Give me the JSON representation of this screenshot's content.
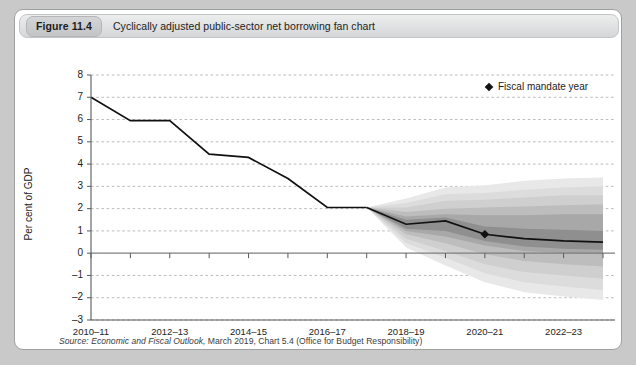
{
  "figure": {
    "number_label": "Figure 11.4",
    "title": "Cyclically adjusted public-sector net borrowing fan chart"
  },
  "source": {
    "label": "Source:",
    "publication": "Economic and Fiscal Outlook,",
    "rest": " March 2019, Chart 5.4 (Office for Budget Responsibility)"
  },
  "legend": {
    "marker": "diamond-marker",
    "label": "Fiscal mandate year"
  },
  "colors": {
    "frame_border": "#9fa0a2",
    "title_bar": "#e2e3e4",
    "line": "#111111",
    "zero_line": "#7d7e80",
    "grid": "#b9bbbd",
    "band_outer": "#e8e8e8",
    "band_mid_outer": "#dcdcdc",
    "band_mid": "#cfcfcf",
    "band_mid_inner": "#bdbdbd",
    "band_inner": "#a8a8a8",
    "band_core": "#8f8f8f"
  },
  "chart_data": {
    "type": "area",
    "title": "Cyclically adjusted public-sector net borrowing fan chart",
    "xlabel": "",
    "ylabel": "Per cent of GDP",
    "ylim": [
      -3,
      8
    ],
    "ytick_values": [
      8,
      7,
      6,
      5,
      4,
      3,
      2,
      1,
      0,
      -1,
      -2,
      -3
    ],
    "ytick_labels": [
      "8",
      "7",
      "6",
      "5",
      "4",
      "3",
      "2",
      "1",
      "0",
      "–1",
      "–2",
      "–3"
    ],
    "grid": true,
    "legend_position": "top-right",
    "x": [
      "2010–11",
      "2011–12",
      "2012–13",
      "2013–14",
      "2014–15",
      "2015–16",
      "2016–17",
      "2017–18",
      "2018–19",
      "2019–20",
      "2020–21",
      "2021–22",
      "2022–23",
      "2023–24"
    ],
    "xtick_labels": [
      "2010–11",
      "2012–13",
      "2014–15",
      "2016–17",
      "2018–19",
      "2020–21",
      "2022–23"
    ],
    "xtick_indices": [
      0,
      2,
      4,
      6,
      8,
      10,
      12
    ],
    "series": [
      {
        "name": "Historical outturn",
        "type": "line",
        "values": [
          7.0,
          5.95,
          5.95,
          4.45,
          4.3,
          3.35,
          2.05,
          2.05,
          null,
          null,
          null,
          null,
          null,
          null
        ]
      },
      {
        "name": "Central forecast",
        "type": "line",
        "values": [
          null,
          null,
          null,
          null,
          null,
          null,
          null,
          2.05,
          1.3,
          1.45,
          0.85,
          0.65,
          0.55,
          0.5
        ]
      }
    ],
    "fan_start_index": 7,
    "fan_bands": [
      {
        "name": "90% interval",
        "shade": "#e8e8e8",
        "upper": [
          2.05,
          2.45,
          2.95,
          3.05,
          3.25,
          3.35,
          3.4
        ],
        "lower": [
          2.05,
          0.25,
          -0.55,
          -1.3,
          -1.75,
          -1.95,
          -2.1
        ]
      },
      {
        "name": "80% interval",
        "shade": "#dcdcdc",
        "upper": [
          2.05,
          2.25,
          2.65,
          2.7,
          2.85,
          2.95,
          3.0
        ],
        "lower": [
          2.05,
          0.45,
          -0.2,
          -0.9,
          -1.3,
          -1.5,
          -1.65
        ]
      },
      {
        "name": "60% interval",
        "shade": "#cfcfcf",
        "upper": [
          2.05,
          2.05,
          2.35,
          2.4,
          2.5,
          2.6,
          2.6
        ],
        "lower": [
          2.05,
          0.65,
          0.1,
          -0.5,
          -0.85,
          -1.0,
          -1.15
        ]
      },
      {
        "name": "40% interval",
        "shade": "#bdbdbd",
        "upper": [
          2.05,
          1.85,
          2.0,
          2.05,
          2.1,
          2.15,
          2.2
        ],
        "lower": [
          2.05,
          0.85,
          0.45,
          -0.05,
          -0.35,
          -0.5,
          -0.6
        ]
      },
      {
        "name": "20% interval",
        "shade": "#a8a8a8",
        "upper": [
          2.05,
          1.65,
          1.75,
          1.7,
          1.7,
          1.75,
          1.75
        ],
        "lower": [
          2.05,
          1.0,
          0.75,
          0.35,
          0.1,
          0.0,
          -0.05
        ]
      },
      {
        "name": "10% interval",
        "shade": "#8f8f8f",
        "upper": [
          2.05,
          1.5,
          1.6,
          1.2,
          1.1,
          1.05,
          1.0
        ],
        "lower": [
          2.05,
          1.1,
          1.0,
          0.55,
          0.3,
          0.2,
          0.15
        ]
      }
    ],
    "annotations": [
      {
        "name": "fiscal-mandate-year",
        "x": "2020–21",
        "y": 0.85,
        "marker": "diamond"
      }
    ]
  }
}
